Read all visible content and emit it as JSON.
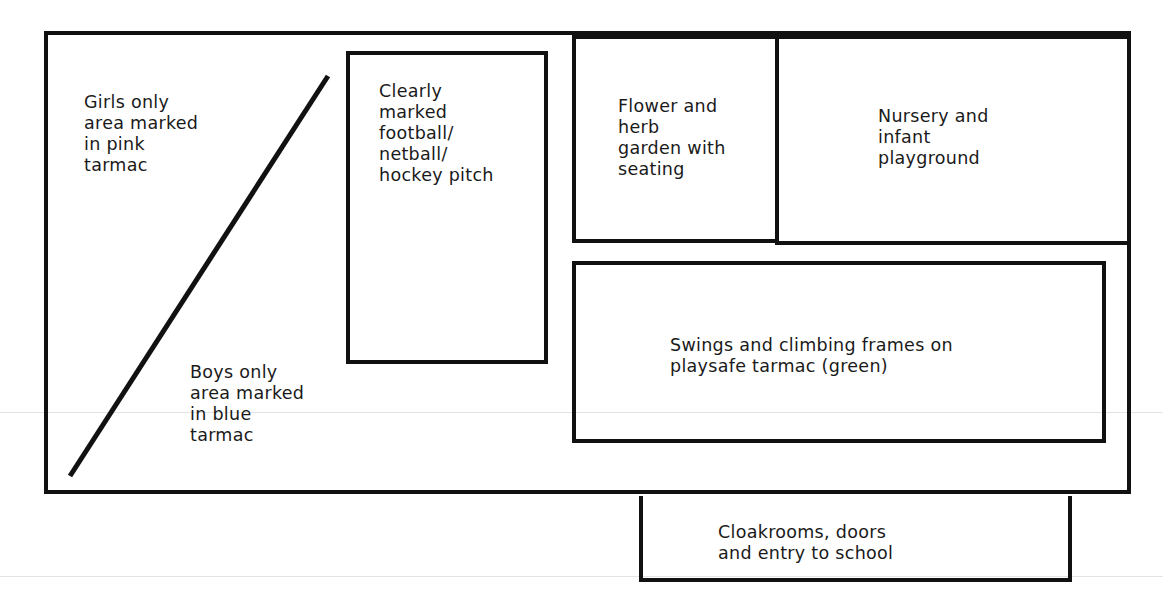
{
  "diagram": {
    "stroke_color": "#111111",
    "background": "#ffffff",
    "areas": {
      "girls": {
        "label": "Girls only\narea marked\nin pink\ntarmac"
      },
      "boys": {
        "label": "Boys only\narea marked\nin blue\ntarmac"
      },
      "pitch": {
        "label": "Clearly\nmarked\nfootball/\nnetball/\nhockey pitch"
      },
      "garden": {
        "label": "Flower and\nherb\ngarden with\nseating"
      },
      "nursery": {
        "label": "Nursery and\ninfant\nplayground"
      },
      "swings": {
        "label": "Swings and climbing frames on\nplaysafe tarmac (green)"
      },
      "entry": {
        "label": "Cloakrooms, doors\nand entry to school"
      }
    },
    "divider": {
      "name": "girls-boys-divider-line",
      "from": [
        70,
        476
      ],
      "to": [
        328,
        76
      ]
    }
  }
}
